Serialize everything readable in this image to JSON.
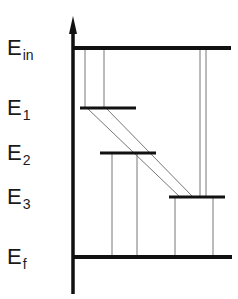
{
  "labels": [
    {
      "id": "E_in",
      "main": "E",
      "sub": "in",
      "x": 7,
      "y": 37
    },
    {
      "id": "E_1",
      "main": "E",
      "sub": "1",
      "x": 7,
      "y": 97
    },
    {
      "id": "E_2",
      "main": "E",
      "sub": "2",
      "x": 7,
      "y": 142
    },
    {
      "id": "E_3",
      "main": "E",
      "sub": "3",
      "x": 7,
      "y": 186
    },
    {
      "id": "E_f",
      "main": "E",
      "sub": "f",
      "x": 7,
      "y": 246
    }
  ],
  "axis": {
    "x": 73,
    "y_top": 16,
    "y_bottom": 294,
    "color": "#111111"
  },
  "levels": [
    {
      "id": "E_in",
      "y": 48,
      "x1": 73,
      "x2": 231
    },
    {
      "id": "E_1",
      "y": 108,
      "x1": 80,
      "x2": 136
    },
    {
      "id": "E_2",
      "y": 153,
      "x1": 100,
      "x2": 156
    },
    {
      "id": "E_3",
      "y": 197,
      "x1": 169,
      "x2": 225
    },
    {
      "id": "E_f",
      "y": 257,
      "x1": 73,
      "x2": 232
    }
  ],
  "transitions": [
    {
      "from": "E_in",
      "to": "E_1",
      "x1": 85,
      "y1": 48,
      "x2": 85,
      "y2": 108
    },
    {
      "from": "E_in",
      "to": "E_1",
      "x1": 104,
      "y1": 48,
      "x2": 104,
      "y2": 108
    },
    {
      "from": "E_in",
      "to": "E_3",
      "x1": 200,
      "y1": 48,
      "x2": 200,
      "y2": 197
    },
    {
      "from": "E_in",
      "to": "E_3",
      "x1": 206,
      "y1": 48,
      "x2": 206,
      "y2": 197
    },
    {
      "from": "E_1",
      "to": "E_3",
      "x1": 87,
      "y1": 108,
      "x2": 180,
      "y2": 197
    },
    {
      "from": "E_1",
      "to": "E_3",
      "x1": 106,
      "y1": 108,
      "x2": 193,
      "y2": 197
    },
    {
      "from": "E_2",
      "to": "E_f",
      "x1": 112,
      "y1": 153,
      "x2": 112,
      "y2": 257
    },
    {
      "from": "E_2",
      "to": "E_f",
      "x1": 137,
      "y1": 153,
      "x2": 137,
      "y2": 257
    },
    {
      "from": "E_3",
      "to": "E_f",
      "x1": 175,
      "y1": 197,
      "x2": 175,
      "y2": 257
    },
    {
      "from": "E_3",
      "to": "E_f",
      "x1": 213,
      "y1": 197,
      "x2": 213,
      "y2": 257
    }
  ],
  "colors": {
    "level": "#111111",
    "transition": "#777777",
    "text": "#1a1a1a"
  }
}
